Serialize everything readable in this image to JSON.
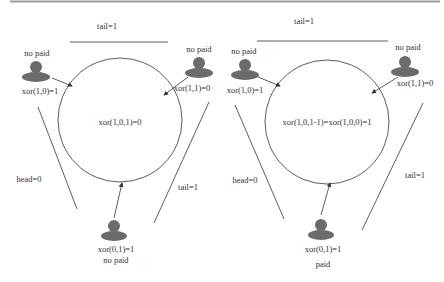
{
  "panels": [
    {
      "id": "left",
      "top_label": "tail=1",
      "left_label": "head=0",
      "right_label": "tail=1",
      "center_text": "xor(1,0,1)=0",
      "persons": {
        "top_left": {
          "status": "no paid",
          "xor": "xor(1,0)=1"
        },
        "top_right": {
          "status": "no paid",
          "xor": "xor(1,1)=0"
        },
        "bottom": {
          "status": "no paid",
          "xor": "xor(0,1)=1"
        }
      }
    },
    {
      "id": "right",
      "top_label": "tail=1",
      "left_label": "head=0",
      "right_label": "tail=1",
      "center_text": "xor(1,0,1-1)=xor(1,0,0)=1",
      "persons": {
        "top_left": {
          "status": "no paid",
          "xor": "xor(1,0)=1"
        },
        "top_right": {
          "status": "no paid",
          "xor": "xor(1,1)=0"
        },
        "bottom": {
          "status": "paid",
          "xor": "xor(0,1)=1"
        }
      }
    }
  ],
  "colors": {
    "person_fill": "#6b6b6b",
    "line": "#333333",
    "top_rule": "#9a9a9a"
  }
}
